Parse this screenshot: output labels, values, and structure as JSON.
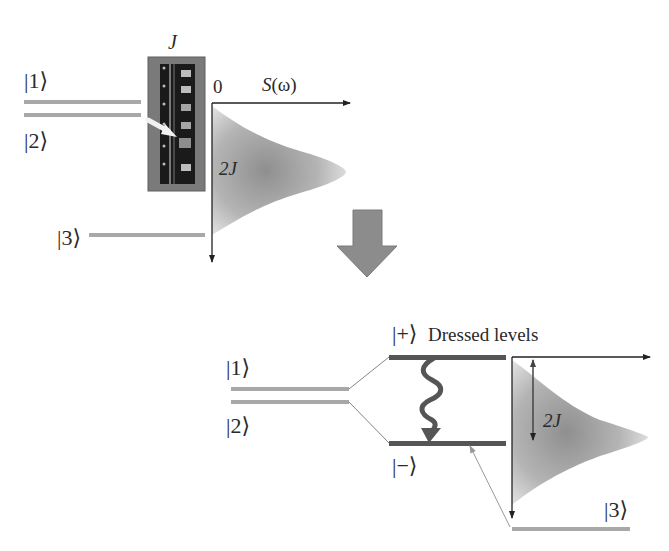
{
  "figure": {
    "top_panel": {
      "coupling_label": "J",
      "state_labels": {
        "s1": "|1⟩",
        "s2": "|2⟩",
        "s3": "|3⟩"
      },
      "axis_origin": "0",
      "axis_label": "S(ω)",
      "width_label": "2J",
      "device_image": "qubit-chip-photo"
    },
    "transition_arrow": "down-arrow",
    "bottom_panel": {
      "state_labels": {
        "s1": "|1⟩",
        "s2": "|2⟩",
        "s3": "|3⟩",
        "plus": "|+⟩",
        "minus": "|−⟩"
      },
      "dressed_title": "Dressed levels",
      "width_label": "2J"
    },
    "colors": {
      "bare_level": "#a8a8a8",
      "dressed_level": "#555555",
      "axis": "#222222",
      "spectrum_fill_dark": "#9a9a9a",
      "spectrum_fill_light": "#e4e4e4",
      "big_arrow": "#8c8c8c",
      "chip_frame": "#7a7a7a"
    }
  }
}
